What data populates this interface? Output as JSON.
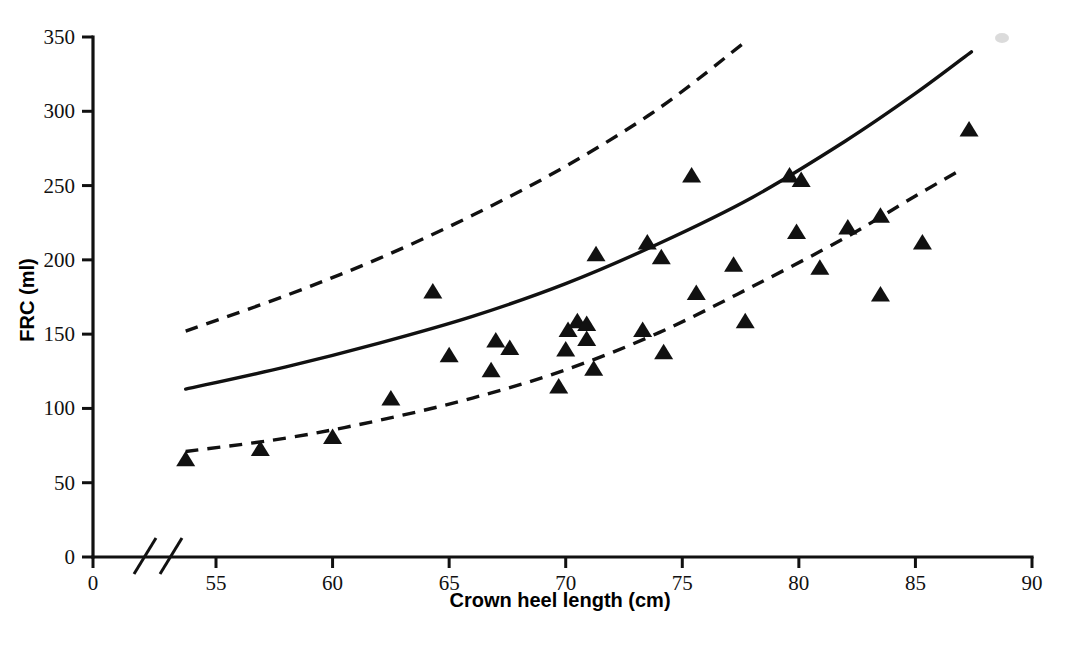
{
  "figure": {
    "background_color": "#ffffff",
    "ink_color": "#111111"
  },
  "axes": {
    "x_title": "Crown heel length (cm)",
    "y_title": "FRC (ml)",
    "x_ticks": [
      "0",
      "55",
      "60",
      "65",
      "70",
      "75",
      "80",
      "85",
      "90"
    ],
    "y_ticks": [
      "0",
      "50",
      "100",
      "150",
      "200",
      "250",
      "300",
      "350"
    ],
    "x_break_note": "axis break between 0 and 55"
  },
  "chart_data": {
    "type": "scatter",
    "title": "",
    "xlabel": "Crown heel length (cm)",
    "ylabel": "FRC (ml)",
    "xlim": [
      0,
      90
    ],
    "ylim": [
      0,
      350
    ],
    "x_ticks": [
      0,
      55,
      60,
      65,
      70,
      75,
      80,
      85,
      90
    ],
    "y_ticks": [
      0,
      50,
      100,
      150,
      200,
      250,
      300,
      350
    ],
    "x_axis_break": true,
    "x_break_range": [
      0,
      53
    ],
    "grid": false,
    "legend": null,
    "marker_shape": "triangle-up",
    "marker_color": "#111111",
    "points": [
      {
        "x": 53.7,
        "y": 65
      },
      {
        "x": 56.9,
        "y": 72
      },
      {
        "x": 60.0,
        "y": 80
      },
      {
        "x": 62.5,
        "y": 106
      },
      {
        "x": 64.3,
        "y": 178
      },
      {
        "x": 65.0,
        "y": 135
      },
      {
        "x": 66.8,
        "y": 125
      },
      {
        "x": 67.0,
        "y": 145
      },
      {
        "x": 67.6,
        "y": 140
      },
      {
        "x": 69.7,
        "y": 114
      },
      {
        "x": 70.0,
        "y": 139
      },
      {
        "x": 70.1,
        "y": 152
      },
      {
        "x": 70.5,
        "y": 158
      },
      {
        "x": 70.9,
        "y": 156
      },
      {
        "x": 70.9,
        "y": 146
      },
      {
        "x": 71.2,
        "y": 126
      },
      {
        "x": 71.3,
        "y": 203
      },
      {
        "x": 73.3,
        "y": 152
      },
      {
        "x": 73.5,
        "y": 211
      },
      {
        "x": 74.1,
        "y": 201
      },
      {
        "x": 74.2,
        "y": 137
      },
      {
        "x": 75.4,
        "y": 256
      },
      {
        "x": 75.6,
        "y": 177
      },
      {
        "x": 77.2,
        "y": 196
      },
      {
        "x": 77.7,
        "y": 158
      },
      {
        "x": 79.6,
        "y": 256
      },
      {
        "x": 79.9,
        "y": 218
      },
      {
        "x": 80.1,
        "y": 253
      },
      {
        "x": 80.9,
        "y": 194
      },
      {
        "x": 82.1,
        "y": 221
      },
      {
        "x": 83.5,
        "y": 229
      },
      {
        "x": 83.5,
        "y": 176
      },
      {
        "x": 85.3,
        "y": 211
      },
      {
        "x": 87.3,
        "y": 287
      }
    ],
    "series": [
      {
        "name": "fitted regression curve",
        "style": "solid",
        "x": [
          53.7,
          58.0,
          62.0,
          66.0,
          70.0,
          74.0,
          78.0,
          82.0,
          85.0,
          87.4
        ],
        "y": [
          113,
          128,
          144,
          162,
          184,
          211,
          242,
          280,
          312,
          340
        ]
      },
      {
        "name": "upper 95% limit",
        "style": "dashed",
        "x": [
          53.7,
          58.0,
          62.0,
          66.0,
          70.0,
          74.0,
          77.8
        ],
        "y": [
          152,
          176,
          201,
          230,
          263,
          302,
          348
        ]
      },
      {
        "name": "lower 95% limit",
        "style": "dashed",
        "x": [
          53.7,
          58.0,
          62.0,
          66.0,
          70.0,
          74.0,
          78.0,
          82.0,
          85.0,
          87.0
        ],
        "y": [
          71,
          80,
          92,
          107,
          126,
          151,
          182,
          215,
          243,
          261
        ]
      }
    ]
  }
}
